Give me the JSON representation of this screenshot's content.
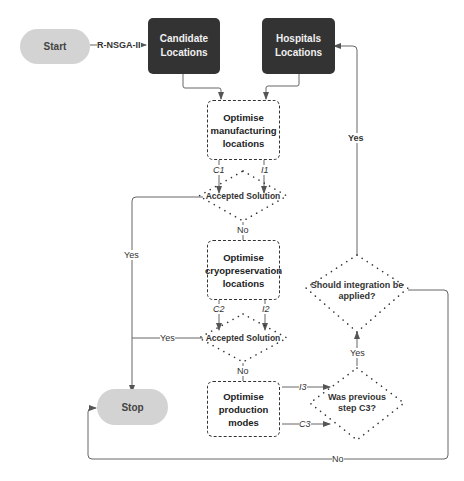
{
  "diagram": {
    "nodes": {
      "start": "Start",
      "candidate": "Candidate Locations",
      "hospitals": "Hospitals Locations",
      "opt_manufacturing": "Optimise manufacturing locations",
      "decision1": "Accepted Solution",
      "opt_cryo": "Optimise cryopreservation locations",
      "decision2": "Accepted Solution",
      "opt_production": "Optimise production modes",
      "decision_c3": "Was previous step C3?",
      "decision_integration": "Should integration be applied?",
      "stop": "Stop"
    },
    "edge_labels": {
      "rnsga": "R-NSGA-II",
      "c1": "C1",
      "i1": "I1",
      "no1": "No",
      "yes1": "Yes",
      "c2": "C2",
      "i2": "I2",
      "no2": "No",
      "yes2": "Yes",
      "i3": "I3",
      "c3": "C3",
      "yes_c3": "Yes",
      "yes_integration": "Yes",
      "no_bottom": "No"
    },
    "colors": {
      "terminal": "#d3d3d3",
      "data_box": "#333333",
      "line": "#555555"
    }
  }
}
